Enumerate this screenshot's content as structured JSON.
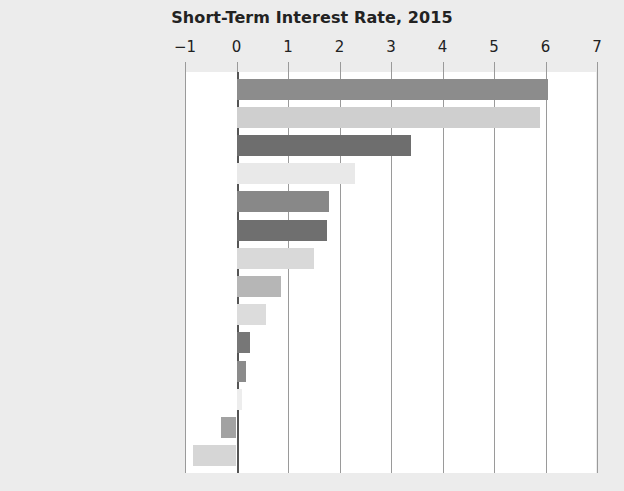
{
  "chart_data": {
    "type": "bar",
    "orientation": "horizontal",
    "title": "Short-Term Interest Rate, 2015",
    "xlabel": "",
    "ylabel": "",
    "xlim": [
      -1,
      7
    ],
    "xticks": [
      -1,
      0,
      1,
      2,
      3,
      4,
      5,
      6,
      7
    ],
    "xtick_labels": [
      "−1",
      "0",
      "1",
      "2",
      "3",
      "4",
      "5",
      "6",
      "7"
    ],
    "grid": true,
    "legend": "none",
    "categories": [
      "South Africa",
      "Iceland",
      "Mexico",
      "Australia",
      "South Korea",
      "Poland",
      "Hungary",
      "Canada",
      "United Kingdom",
      "United States",
      "Japan",
      "Israel",
      "Sweden",
      "Switzerland"
    ],
    "values": [
      6.05,
      5.9,
      3.38,
      2.31,
      1.8,
      1.76,
      1.5,
      0.87,
      0.57,
      0.26,
      0.18,
      0.1,
      -0.31,
      -0.85
    ],
    "bar_colors": [
      "#8c8c8c",
      "#cfcfcf",
      "#6e6e6e",
      "#e9e9e9",
      "#888888",
      "#6f6f6f",
      "#d9d9d9",
      "#b6b6b6",
      "#dcdcdc",
      "#777777",
      "#8b8b8b",
      "#ededed",
      "#a2a2a2",
      "#d6d6d6"
    ]
  },
  "style": {
    "page_background": "#ececec",
    "plot_background": "#ffffff",
    "gridline_color": "#9a9a9a",
    "zero_line_color": "#555555",
    "text_color": "#222222"
  }
}
